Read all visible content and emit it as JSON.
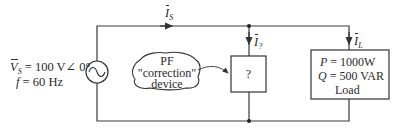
{
  "source": {
    "voltage_symbol": "V",
    "voltage_subscript": "S",
    "voltage_value": " = 100 V∠ 0°",
    "frequency_symbol": "f",
    "frequency_value": " = 60 Hz",
    "icon": "ac-source-icon"
  },
  "currents": {
    "source": {
      "symbol": "I",
      "subscript": "S"
    },
    "device": {
      "symbol": "I",
      "subscript": "?"
    },
    "load": {
      "symbol": "I",
      "subscript": "L"
    }
  },
  "device": {
    "cloud_line1": "PF",
    "cloud_line2": "\"correction\"",
    "cloud_line3": "device",
    "box_label": "?"
  },
  "load": {
    "p_symbol": "P",
    "p_value": " = 1000W",
    "q_symbol": "Q",
    "q_value": " = 500 VAR",
    "label": "Load"
  },
  "colors": {
    "wire": "#3a3a3a",
    "background": "#ffffff"
  }
}
